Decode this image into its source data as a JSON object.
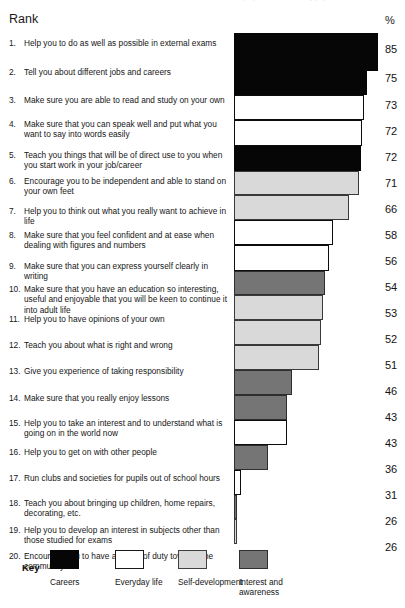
{
  "top_clip_text": "Rank order of purposes of school by pupils",
  "header": {
    "rank_title": "Rank",
    "percent_title": "%"
  },
  "legend": {
    "key_label": "Key",
    "items": [
      {
        "label": "Careers",
        "category": "careers",
        "color": "#060606",
        "left": 50
      },
      {
        "label": "Everyday life",
        "category": "everyday",
        "color": "#ffffff",
        "left": 115
      },
      {
        "label": "Self-development",
        "category": "selfdev",
        "color": "#d9d9d9",
        "left": 178
      },
      {
        "label": "Interest and\nawareness",
        "category": "interest",
        "color": "#757575",
        "left": 239
      }
    ]
  },
  "chart_data": {
    "type": "bar",
    "orientation": "horizontal",
    "title": "Rank",
    "xlabel": "%",
    "ylabel": "Rank",
    "grid": false,
    "legend_position": "bottom",
    "axis_note": "bar lengths measured in pixels from a truncated baseline",
    "categories": [
      "Help you to do as well as possible in external exams",
      "Tell you about different jobs and careers",
      "Make sure you are able to read and study on your own",
      "Make sure that you can speak well and put what you want to say into words easily",
      "Teach you things that will be of direct use to you when you start work in your job/career",
      "Encourage you to be independent and able to stand on your own feet",
      "Help you to think out what you really want to achieve in life",
      "Make sure that you feel confident and at ease when dealing with figures and numbers",
      "Make sure that you can express yourself clearly in writing",
      "Make sure that you have an education so interesting, useful and enjoyable that you will be keen to continue it into adult life",
      "Help you to have opinions of your own",
      "Teach you about what is right and wrong",
      "Give you experience of taking responsibility",
      "Make sure that you really enjoy lessons",
      "Help you to take an interest and to understand what is going on in the world now",
      "Help you to get on with other people",
      "Run clubs and societies for pupils out of school hours",
      "Teach you about bringing up children, home repairs, decorating, etc.",
      "Help you to develop an interest in subjects other than those studied for exams",
      "Encourage you to have a sense of duty towards the community"
    ],
    "values": [
      85,
      75,
      73,
      72,
      72,
      71,
      66,
      58,
      56,
      54,
      53,
      52,
      51,
      46,
      43,
      43,
      36,
      31,
      26,
      26
    ],
    "series": [
      {
        "name": "Purposes of school",
        "values": [
          85,
          75,
          73,
          72,
          72,
          71,
          66,
          58,
          56,
          54,
          53,
          52,
          51,
          46,
          43,
          43,
          36,
          31,
          26,
          26
        ]
      }
    ]
  },
  "rows": [
    {
      "rank": "1.",
      "text": "Help you to do as well as possible in external exams",
      "value": "85",
      "category": "careers",
      "label_top": 5,
      "bar_top": 0,
      "bar_h": 38,
      "bar_w": 144,
      "val_top": 10
    },
    {
      "rank": "2.",
      "text": "Tell you about different jobs and careers",
      "value": "75",
      "category": "careers",
      "label_top": 34,
      "bar_top": 38,
      "bar_h": 24,
      "bar_w": 133,
      "val_top": 39
    },
    {
      "rank": "3.",
      "text": "Make sure you are able to read and study on your own",
      "value": "73",
      "category": "everyday",
      "label_top": 62,
      "bar_top": 62,
      "bar_h": 25,
      "bar_w": 130,
      "val_top": 66
    },
    {
      "rank": "4.",
      "text": "Make sure that you can speak well and put what you want to say into words easily",
      "value": "72",
      "category": "everyday",
      "label_top": 86,
      "bar_top": 87,
      "bar_h": 26,
      "bar_w": 128,
      "val_top": 92
    },
    {
      "rank": "5.",
      "text": "Teach you things that will be of direct use to you when you start work in your job/career",
      "value": "72",
      "category": "careers",
      "label_top": 117,
      "bar_top": 113,
      "bar_h": 25,
      "bar_w": 127,
      "val_top": 118
    },
    {
      "rank": "6.",
      "text": "Encourage you to be independent and able to stand on your own feet",
      "value": "71",
      "category": "selfdev",
      "label_top": 143,
      "bar_top": 138,
      "bar_h": 24,
      "bar_w": 125,
      "val_top": 144
    },
    {
      "rank": "7.",
      "text": "Help you to think out what you really want to achieve in life",
      "value": "66",
      "category": "selfdev",
      "label_top": 173,
      "bar_top": 162,
      "bar_h": 25,
      "bar_w": 115,
      "val_top": 170
    },
    {
      "rank": "8.",
      "text": "Make sure that you feel confident and at ease when dealing with figures and numbers",
      "value": "58",
      "category": "everyday",
      "label_top": 197,
      "bar_top": 187,
      "bar_h": 25,
      "bar_w": 99,
      "val_top": 196
    },
    {
      "rank": "9.",
      "text": "Make sure that you can express yourself clearly in writing",
      "value": "56",
      "category": "everyday",
      "label_top": 228,
      "bar_top": 212,
      "bar_h": 26,
      "bar_w": 95,
      "val_top": 222
    },
    {
      "rank": "10.",
      "text": "Make sure that you have an education so interesting, useful and enjoyable that you will be keen to continue it into adult life",
      "value": "54",
      "category": "interest",
      "label_top": 251,
      "bar_top": 238,
      "bar_h": 24,
      "bar_w": 91,
      "val_top": 248
    },
    {
      "rank": "11.",
      "text": "Help you to have opinions of your own",
      "value": "53",
      "category": "selfdev",
      "label_top": 281,
      "bar_top": 262,
      "bar_h": 25,
      "bar_w": 89,
      "val_top": 274
    },
    {
      "rank": "12.",
      "text": "Teach you about what is right and wrong",
      "value": "52",
      "category": "selfdev",
      "label_top": 307,
      "bar_top": 287,
      "bar_h": 25,
      "bar_w": 87,
      "val_top": 300
    },
    {
      "rank": "13.",
      "text": "Give you experience of taking responsibility",
      "value": "51",
      "category": "selfdev",
      "label_top": 333,
      "bar_top": 312,
      "bar_h": 25,
      "bar_w": 85,
      "val_top": 326
    },
    {
      "rank": "14.",
      "text": "Make sure that you really enjoy lessons",
      "value": "46",
      "category": "interest",
      "label_top": 360,
      "bar_top": 337,
      "bar_h": 25,
      "bar_w": 58,
      "val_top": 352
    },
    {
      "rank": "15.",
      "text": "Help you to take an interest and to understand what is going on in the world now",
      "value": "43",
      "category": "interest",
      "label_top": 385,
      "bar_top": 362,
      "bar_h": 25,
      "bar_w": 53,
      "val_top": 378
    },
    {
      "rank": "16.",
      "text": "Help you to get on with other people",
      "value": "43",
      "category": "everyday",
      "label_top": 414,
      "bar_top": 387,
      "bar_h": 25,
      "bar_w": 53,
      "val_top": 404
    },
    {
      "rank": "17.",
      "text": "Run clubs and societies for pupils out of school hours",
      "value": "36",
      "category": "interest",
      "label_top": 440,
      "bar_top": 412,
      "bar_h": 25,
      "bar_w": 34,
      "val_top": 430
    },
    {
      "rank": "18.",
      "text": "Teach you about bringing up children, home repairs, decorating, etc.",
      "value": "31",
      "category": "everyday",
      "label_top": 465,
      "bar_top": 437,
      "bar_h": 25,
      "bar_w": 7,
      "val_top": 456
    },
    {
      "rank": "19.",
      "text": "Help you to develop an interest in subjects other than those studied for exams",
      "value": "26",
      "category": "interest",
      "label_top": 492,
      "bar_top": 462,
      "bar_h": 24,
      "bar_w": 3,
      "val_top": 482
    },
    {
      "rank": "20.",
      "text": "Encourage you to have a sense of duty towards the community",
      "value": "26",
      "category": "selfdev",
      "label_top": 518,
      "bar_top": 486,
      "bar_h": 25,
      "bar_w": 3,
      "val_top": 508
    }
  ]
}
